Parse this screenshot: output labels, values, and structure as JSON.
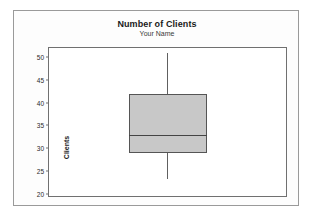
{
  "figure": {
    "title": "Number of Clients",
    "subtitle": "Your Name"
  },
  "axes": {
    "ylabel": "Clients",
    "yticks": [
      "50",
      "45",
      "40",
      "35",
      "30",
      "25",
      "20"
    ]
  },
  "colors": {
    "box_fill": "#c8c8c8",
    "box_edge": "#555555",
    "median": "#444444",
    "whisker": "#606060",
    "frame": "#707070",
    "outer_frame": "#9a9a9a",
    "text": "#1a1a1a"
  },
  "chart_data": {
    "type": "box",
    "title": "Number of Clients",
    "subtitle": "Your Name",
    "xlabel": "",
    "ylabel": "Clients",
    "ylim": [
      19.5,
      52.0
    ],
    "ytick_values": [
      50,
      45,
      40,
      35,
      30,
      25,
      20
    ],
    "grid": false,
    "legend": false,
    "orientation": "vertical",
    "categories": [
      ""
    ],
    "boxes": [
      {
        "name": "Clients",
        "whisker_low": 23.3,
        "q1": 29.0,
        "median": 33.0,
        "q3": 42.0,
        "whisker_high": 51.0,
        "outliers": [],
        "caps": false
      }
    ]
  }
}
